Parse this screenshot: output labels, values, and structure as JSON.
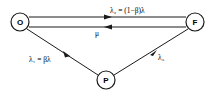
{
  "diagram": {
    "type": "state-transition",
    "nodes": [
      {
        "id": "O",
        "label": "O",
        "cx": 20,
        "cy": 22,
        "r": 9
      },
      {
        "id": "F",
        "label": "F",
        "cx": 195,
        "cy": 22,
        "r": 9
      },
      {
        "id": "P",
        "label": "P",
        "cx": 106,
        "cy": 80,
        "r": 9
      }
    ],
    "edges": [
      {
        "from": "O",
        "to": "F",
        "label": "λ₂ = (1−β)λ"
      },
      {
        "from": "F",
        "to": "O",
        "label": "μ"
      },
      {
        "from": "O",
        "to": "P",
        "label": "λ₁ = βλ"
      },
      {
        "from": "P",
        "to": "F",
        "label": "λ₃"
      }
    ],
    "colors": {
      "stroke": "#1a1a1a",
      "background": "#ffffff"
    }
  }
}
